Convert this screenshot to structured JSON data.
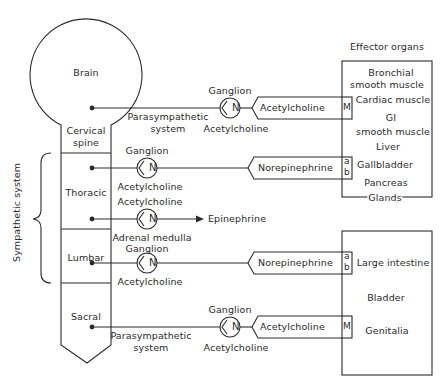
{
  "diagram": {
    "type": "autonomic nervous system pathways",
    "colors": {
      "line": "#2a2a2a",
      "background": "#ffffff"
    },
    "cns": {
      "brain": "Brain",
      "segments": [
        "Cervical spine",
        "Thoracic",
        "Lumbar",
        "Sacral"
      ],
      "cervical_line1": "Cervical",
      "cervical_line2": "spine"
    },
    "bracket_label": "Sympathetic system",
    "effector_header": "Effector organs",
    "pathways": [
      {
        "id": "cranial-parasympathetic",
        "origin": "Brain",
        "system_line1": "Parasympathetic",
        "system_line2": "system",
        "ganglion_label": "Ganglion",
        "ganglion_symbol": "N",
        "preganglionic_transmitter": "Acetylcholine",
        "postganglionic_transmitter": "Acetylcholine",
        "receptor": "M"
      },
      {
        "id": "thoracic-sympathetic",
        "origin": "Thoracic",
        "ganglion_label": "Ganglion",
        "ganglion_symbol": "N",
        "preganglionic_transmitter": "Acetylcholine",
        "postganglionic_transmitter": "Norepinephrine",
        "receptor_top": "a",
        "receptor_bottom": "b"
      },
      {
        "id": "adrenal-medulla",
        "origin": "Thoracic",
        "top_label": "Acetylcholine",
        "ganglion_symbol": "N",
        "bottom_label": "Adrenal medulla",
        "output": "Epinephrine"
      },
      {
        "id": "lumbar-sympathetic",
        "origin": "Lumbar",
        "ganglion_label": "Ganglion",
        "ganglion_symbol": "N",
        "preganglionic_transmitter": "Acetylcholine",
        "postganglionic_transmitter": "Norepinephrine",
        "receptor_top": "a",
        "receptor_bottom": "b"
      },
      {
        "id": "sacral-parasympathetic",
        "origin": "Sacral",
        "system_line1": "Parasympathetic",
        "system_line2": "system",
        "ganglion_label": "Ganglion",
        "ganglion_symbol": "N",
        "preganglionic_transmitter": "Acetylcholine",
        "postganglionic_transmitter": "Acetylcholine",
        "receptor": "M"
      }
    ],
    "effector_box_upper": {
      "organs": [
        "Bronchial smooth muscle",
        "Cardiac muscle",
        "GI smooth muscle",
        "Liver",
        "Gallbladder",
        "Pancreas",
        "Glands"
      ],
      "bronchial_line1": "Bronchial",
      "bronchial_line2": "smooth muscle",
      "gi_line1": "GI",
      "gi_line2": "smooth muscle"
    },
    "effector_box_lower": {
      "organs": [
        "Large intestine",
        "Bladder",
        "Genitalia"
      ]
    }
  }
}
